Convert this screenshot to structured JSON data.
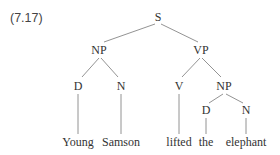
{
  "example_number": "(7.17)",
  "tree": {
    "nodes": [
      {
        "id": "S",
        "label": "S",
        "x": 158,
        "y": 21
      },
      {
        "id": "NP1",
        "label": "NP",
        "x": 99,
        "y": 54
      },
      {
        "id": "VP",
        "label": "VP",
        "x": 201,
        "y": 54
      },
      {
        "id": "D1",
        "label": "D",
        "x": 78,
        "y": 90
      },
      {
        "id": "N1",
        "label": "N",
        "x": 121,
        "y": 90
      },
      {
        "id": "V",
        "label": "V",
        "x": 179,
        "y": 90
      },
      {
        "id": "NP2",
        "label": "NP",
        "x": 224,
        "y": 90
      },
      {
        "id": "D2",
        "label": "D",
        "x": 206,
        "y": 114
      },
      {
        "id": "N2",
        "label": "N",
        "x": 246,
        "y": 114
      }
    ],
    "words": [
      {
        "id": "w1",
        "text": "Young",
        "x": 78,
        "y": 146
      },
      {
        "id": "w2",
        "text": "Samson",
        "x": 121,
        "y": 146
      },
      {
        "id": "w3",
        "text": "lifted",
        "x": 179,
        "y": 146
      },
      {
        "id": "w4",
        "text": "the",
        "x": 206,
        "y": 146
      },
      {
        "id": "w5",
        "text": "elephant",
        "x": 246,
        "y": 146
      }
    ],
    "edges": [
      {
        "x1": 155,
        "y1": 24,
        "x2": 104,
        "y2": 42
      },
      {
        "x1": 161,
        "y1": 24,
        "x2": 198,
        "y2": 42
      },
      {
        "x1": 99,
        "y1": 58,
        "x2": 82,
        "y2": 77
      },
      {
        "x1": 101,
        "y1": 58,
        "x2": 118,
        "y2": 77
      },
      {
        "x1": 200,
        "y1": 58,
        "x2": 182,
        "y2": 77
      },
      {
        "x1": 202,
        "y1": 58,
        "x2": 221,
        "y2": 77
      },
      {
        "x1": 223,
        "y1": 94,
        "x2": 209,
        "y2": 103
      },
      {
        "x1": 226,
        "y1": 94,
        "x2": 243,
        "y2": 103
      },
      {
        "x1": 78,
        "y1": 94,
        "x2": 78,
        "y2": 134
      },
      {
        "x1": 121,
        "y1": 94,
        "x2": 121,
        "y2": 134
      },
      {
        "x1": 179,
        "y1": 94,
        "x2": 179,
        "y2": 134
      },
      {
        "x1": 206,
        "y1": 118,
        "x2": 206,
        "y2": 134
      },
      {
        "x1": 246,
        "y1": 118,
        "x2": 246,
        "y2": 134
      }
    ]
  }
}
